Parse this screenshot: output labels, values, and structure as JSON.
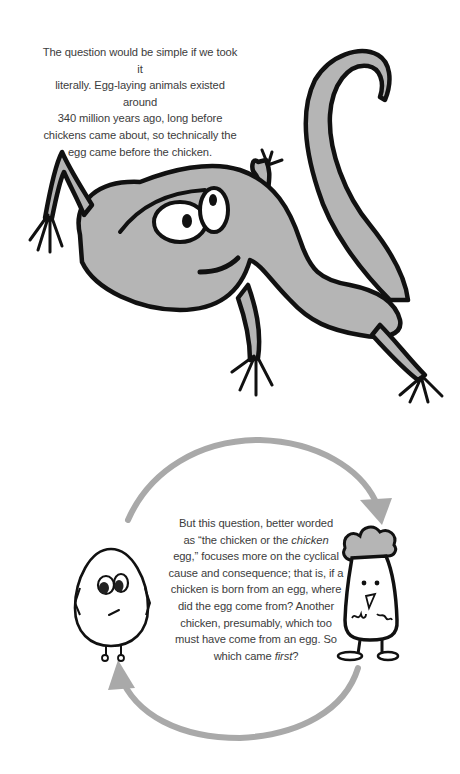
{
  "page": {
    "section_1": {
      "paragraph": "The question would be simple if we took it literally. Egg-laying animals existed around 340 million years ago, long before chickens came about, so technically the egg came before the chicken.",
      "lines": [
        "The question would be simple if we took it",
        "literally. Egg-laying animals existed around",
        "340 million years ago, long before",
        "chickens came about, so technically the",
        "egg came before the chicken."
      ],
      "illustration": "lizard-drawing"
    },
    "section_2": {
      "lines": [
        {
          "parts": [
            {
              "text": "But this question, better worded",
              "italic": false
            }
          ]
        },
        {
          "parts": [
            {
              "text": "as “the chicken or the ",
              "italic": false
            },
            {
              "text": "chicken",
              "italic": true
            }
          ]
        },
        {
          "parts": [
            {
              "text": "egg,” focuses more on the cyclical",
              "italic": false
            }
          ]
        },
        {
          "parts": [
            {
              "text": "cause and consequence; that is, if a",
              "italic": false
            }
          ]
        },
        {
          "parts": [
            {
              "text": "chicken is born from an egg, where",
              "italic": false
            }
          ]
        },
        {
          "parts": [
            {
              "text": "did the egg come from? Another",
              "italic": false
            }
          ]
        },
        {
          "parts": [
            {
              "text": "chicken, presumably, which too",
              "italic": false
            }
          ]
        },
        {
          "parts": [
            {
              "text": "must have come from an egg. So",
              "italic": false
            }
          ]
        },
        {
          "parts": [
            {
              "text": "which came ",
              "italic": false
            },
            {
              "text": "first",
              "italic": true
            },
            {
              "text": "?",
              "italic": false
            }
          ]
        }
      ],
      "illustrations": [
        "egg-character",
        "chicken-character",
        "cycle-arrows"
      ]
    },
    "colors": {
      "text": "#3c3c3c",
      "ink": "#111111",
      "gray_fill": "#b4b4b4",
      "arrow_gray": "#a9a9a9",
      "background": "#ffffff"
    }
  }
}
